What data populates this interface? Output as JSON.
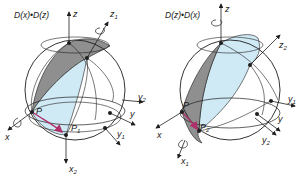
{
  "colors": {
    "line": "#1e1e1e",
    "gray_band": "#8f8f8f",
    "light_blue": "#cfe9f5",
    "arrow_pink": "#b0306a",
    "background": "#ffffff"
  },
  "left_figure": {
    "title": "D(x)•D(z)",
    "axes": {
      "z": "z",
      "z1": "z",
      "z1_sub": "1",
      "y": "y",
      "y1": "y",
      "y1_sub": "1",
      "y2": "y",
      "y2_sub": "2",
      "x": "x",
      "x2": "x",
      "x2_sub": "2"
    },
    "points": {
      "P": "P",
      "P1": "P",
      "P1_sub": "1"
    }
  },
  "right_figure": {
    "title": "D(z)•D(x)",
    "axes": {
      "z": "z",
      "z2": "z",
      "z2_sub": "2",
      "y": "y",
      "y1": "y",
      "y1_sub": "1",
      "y2": "y",
      "y2_sub": "2",
      "x": "x",
      "x1": "x",
      "x1_sub": "1"
    },
    "points": {
      "P": "P",
      "P2": "P",
      "P2_sub": "2"
    }
  }
}
